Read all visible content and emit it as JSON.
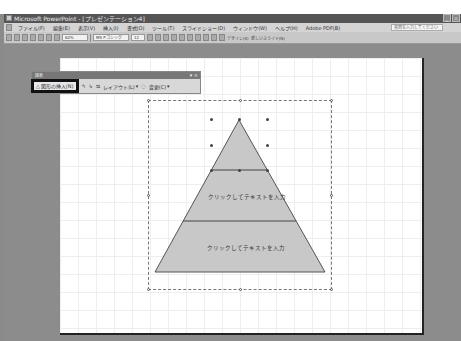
{
  "window": {
    "title": "Microsoft PowerPoint - [プレゼンテーション4]",
    "controls": [
      "minimize",
      "restore"
    ]
  },
  "menubar": {
    "items": [
      "ファイル(F)",
      "編集(E)",
      "表示(V)",
      "挿入(I)",
      "書式(O)",
      "ツール(T)",
      "スライドショー(D)",
      "ウィンドウ(W)",
      "ヘルプ(H)",
      "Adobe PDF(B)"
    ],
    "help_placeholder": "質問を入力してください"
  },
  "toolbar": {
    "zoom": "62%",
    "font_name": "MS Pゴシック",
    "font_size": "12",
    "design_label": "デザイン(S)",
    "new_slide_label": "新しいスライド(N)"
  },
  "diagram_toolbar": {
    "title": "図表",
    "insert_shape_label": "図形の挿入(N)",
    "layout_label": "レイアウト(L)",
    "change_to_label": "変更(C)"
  },
  "diagram": {
    "type": "pyramid",
    "levels": [
      {
        "text": ""
      },
      {
        "text": "クリックしてテキストを入力"
      },
      {
        "text": "クリックしてテキストを入力"
      }
    ],
    "fill_color": "#c8c8c8",
    "line_color": "#555555"
  }
}
